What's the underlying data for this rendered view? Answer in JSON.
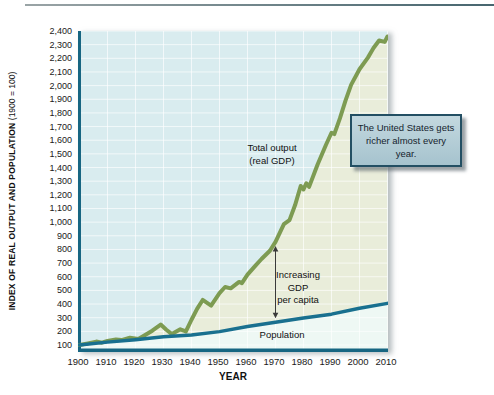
{
  "y_axis": {
    "title_main": "INDEX OF REAL OUTPUT AND POPULATION",
    "title_paren": " (1900 = 100)",
    "ticks": [
      "2,400",
      "2,300",
      "2,200",
      "2,100",
      "2,000",
      "1,900",
      "1,800",
      "1,700",
      "1,600",
      "1,500",
      "1,400",
      "1,300",
      "1,200",
      "1,100",
      "1,000",
      "900",
      "800",
      "700",
      "600",
      "500",
      "400",
      "300",
      "200",
      "100"
    ]
  },
  "x_axis": {
    "title": "YEAR",
    "ticks": [
      "1900",
      "1910",
      "1920",
      "1930",
      "1940",
      "1950",
      "1960",
      "1970",
      "1980",
      "1990",
      "2000",
      "2010"
    ]
  },
  "annotations": {
    "total_output_line1": "Total output",
    "total_output_line2": "(real GDP)",
    "increasing_line1": "Increasing",
    "increasing_line2": "GDP",
    "increasing_line3": "per capita",
    "population_label": "Population",
    "callout_text": "The United States gets richer almost every year."
  },
  "colors": {
    "gdp_line": "#7d9b52",
    "population_line": "#19708f",
    "plot_bg": "#d9ecef",
    "under_gdp_fill": "#e9edda",
    "under_population_fill": "#eef8f4",
    "grid": "#ffffff",
    "axis_line": "#176682",
    "arrow": "#3a3a3a",
    "callout_bg": "#aec9d4",
    "callout_border": "#234f63"
  },
  "chart_data": {
    "type": "line",
    "title": "",
    "xlabel": "YEAR",
    "ylabel": "INDEX OF REAL OUTPUT AND POPULATION (1900 = 100)",
    "xlim": [
      1900,
      2010
    ],
    "ylim": [
      100,
      2400
    ],
    "x_tick_step": 10,
    "y_tick_step": 100,
    "grid": true,
    "legend_position": "inline-labels",
    "series": [
      {
        "name": "Total output (real GDP)",
        "color": "#7d9b52",
        "points": [
          [
            1900,
            100
          ],
          [
            1903,
            112
          ],
          [
            1906,
            125
          ],
          [
            1908,
            117
          ],
          [
            1910,
            130
          ],
          [
            1913,
            141
          ],
          [
            1915,
            136
          ],
          [
            1918,
            153
          ],
          [
            1921,
            144
          ],
          [
            1923,
            168
          ],
          [
            1926,
            205
          ],
          [
            1929,
            250
          ],
          [
            1931,
            212
          ],
          [
            1933,
            180
          ],
          [
            1936,
            215
          ],
          [
            1938,
            199
          ],
          [
            1940,
            285
          ],
          [
            1942,
            365
          ],
          [
            1944,
            430
          ],
          [
            1947,
            388
          ],
          [
            1950,
            480
          ],
          [
            1952,
            525
          ],
          [
            1954,
            515
          ],
          [
            1957,
            562
          ],
          [
            1958,
            553
          ],
          [
            1960,
            615
          ],
          [
            1963,
            685
          ],
          [
            1965,
            730
          ],
          [
            1968,
            790
          ],
          [
            1970,
            855
          ],
          [
            1973,
            985
          ],
          [
            1975,
            1015
          ],
          [
            1977,
            1125
          ],
          [
            1979,
            1265
          ],
          [
            1980,
            1240
          ],
          [
            1981,
            1285
          ],
          [
            1982,
            1258
          ],
          [
            1985,
            1420
          ],
          [
            1988,
            1565
          ],
          [
            1990,
            1655
          ],
          [
            1991,
            1645
          ],
          [
            1993,
            1760
          ],
          [
            1995,
            1890
          ],
          [
            1997,
            2005
          ],
          [
            2000,
            2120
          ],
          [
            2003,
            2205
          ],
          [
            2005,
            2275
          ],
          [
            2007,
            2330
          ],
          [
            2009,
            2320
          ],
          [
            2010,
            2360
          ]
        ]
      },
      {
        "name": "Population",
        "color": "#19708f",
        "points": [
          [
            1900,
            100
          ],
          [
            1910,
            121
          ],
          [
            1920,
            139
          ],
          [
            1930,
            161
          ],
          [
            1940,
            173
          ],
          [
            1950,
            198
          ],
          [
            1960,
            235
          ],
          [
            1970,
            267
          ],
          [
            1980,
            297
          ],
          [
            1990,
            326
          ],
          [
            2000,
            369
          ],
          [
            2010,
            405
          ]
        ]
      }
    ],
    "annotation_arrow": {
      "year": 1970,
      "from_value": 855,
      "to_value": 267,
      "label": "Increasing GDP per capita"
    },
    "callout": "The United States gets richer almost every year."
  }
}
